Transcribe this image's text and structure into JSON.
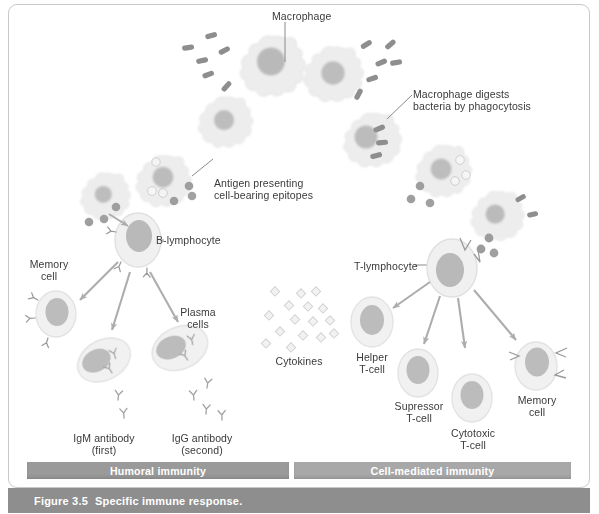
{
  "figure": {
    "border_color": "#c9c9c9",
    "caption_number": "Figure 3.5",
    "caption_text": "Specific immune response.",
    "caption_bg": "#8e8e8e"
  },
  "labels": {
    "macrophage": "Macrophage",
    "phagocytosis_l1": "Macrophage digests",
    "phagocytosis_l2": "bacteria by phagocytosis",
    "apc_l1": "Antigen presenting",
    "apc_l2": "cell-bearing epitopes",
    "b_lymphocyte": "B-lymphocyte",
    "memory_cell_l1": "Memory",
    "memory_cell_l2": "cell",
    "plasma_cells_l1": "Plasma",
    "plasma_cells_l2": "cells",
    "igm_l1": "IgM antibody",
    "igm_l2": "(first)",
    "igg_l1": "IgG antibody",
    "igg_l2": "(second)",
    "cytokines": "Cytokines",
    "t_lymphocyte": "T-lymphocyte",
    "helper_l1": "Helper",
    "helper_l2": "T-cell",
    "supressor_l1": "Supressor",
    "supressor_l2": "T-cell",
    "cytotoxic_l1": "Cytotoxic",
    "cytotoxic_l2": "T-cell",
    "memory_t_l1": "Memory",
    "memory_t_l2": "cell"
  },
  "bars": {
    "humoral": "Humoral immunity",
    "cell_mediated": "Cell-mediated immunity",
    "humoral_color": "#9a9a9a",
    "cell_mediated_color": "#a8a8a8"
  },
  "colors": {
    "cytoplasm": "#ededed",
    "cytoplasm_edge": "#dcdcdc",
    "nucleus": "#b9b9b9",
    "bacteria": "#8e8e8e",
    "epitope": "#9e9e9e",
    "arrow": "#adadad",
    "leader": "#8a8a8a",
    "text": "#3a3a3a"
  }
}
